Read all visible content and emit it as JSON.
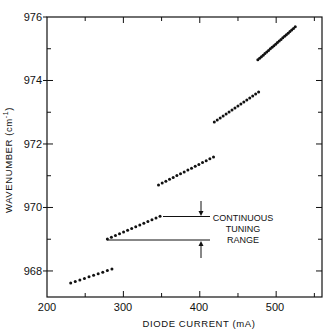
{
  "chart_data": {
    "type": "scatter",
    "title": "",
    "xlabel": "DIODE CURRENT (mA)",
    "ylabel": "WAVENUMBER (cm⁻¹)",
    "xlim": [
      200,
      560
    ],
    "ylim": [
      967.18,
      976
    ],
    "xticks": [
      200,
      300,
      400,
      500
    ],
    "xminor": [
      250,
      350,
      450,
      550
    ],
    "yticks": [
      968,
      970,
      972,
      974,
      976
    ],
    "yminor": [
      969,
      971,
      973,
      975
    ],
    "grid": false,
    "legend": null,
    "series": [
      {
        "name": "mode 1",
        "x_start": 231,
        "x_end": 285,
        "y_start": 967.62,
        "y_end": 968.06,
        "n_points": 10
      },
      {
        "name": "mode 2",
        "x_start": 279,
        "x_end": 348,
        "y_start": 969.01,
        "y_end": 969.72,
        "n_points": 14
      },
      {
        "name": "mode 3",
        "x_start": 346,
        "x_end": 418,
        "y_start": 970.71,
        "y_end": 971.59,
        "n_points": 16
      },
      {
        "name": "mode 4",
        "x_start": 419,
        "x_end": 477,
        "y_start": 972.69,
        "y_end": 973.64,
        "n_points": 16
      },
      {
        "name": "mode 5",
        "x_start": 476,
        "x_end": 525,
        "y_start": 974.65,
        "y_end": 975.69,
        "n_points": 22
      }
    ],
    "annotations": [
      {
        "text": "CONTINUOUS TUNING RANGE",
        "lines": [
          "CONTINUOUS",
          "TUNING",
          "RANGE"
        ],
        "indicates_y_range": [
          969.01,
          969.72
        ]
      }
    ]
  },
  "ui": {
    "xtick_labels": [
      "200",
      "300",
      "400",
      "500"
    ],
    "ytick_labels": [
      "968",
      "970",
      "972",
      "974",
      "976"
    ],
    "annotation_lines": [
      "CONTINUOUS",
      "TUNING",
      "RANGE"
    ],
    "xlabel": "DIODE CURRENT (mA)",
    "ylabel_main": "WAVENUMBER (cm",
    "ylabel_sup": "-1",
    "ylabel_close": ")",
    "colors": {
      "ink": "#111111",
      "background": "#ffffff"
    }
  }
}
